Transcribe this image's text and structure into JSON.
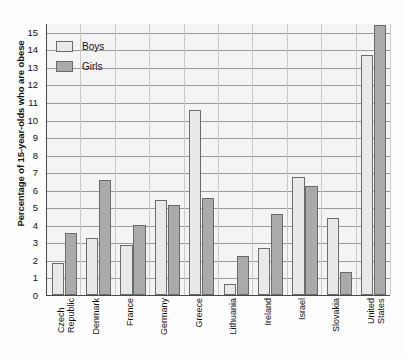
{
  "chart_data": {
    "type": "bar",
    "title": "",
    "xlabel": "",
    "ylabel": "Percentage of 15-year-olds who are obese",
    "ylim": [
      0,
      15.5
    ],
    "yticks": [
      0,
      1,
      2,
      3,
      4,
      5,
      6,
      7,
      8,
      9,
      10,
      11,
      12,
      13,
      14,
      15
    ],
    "ytick_labels": [
      "0",
      "1",
      "2",
      "3",
      "4",
      "5",
      "6",
      "7",
      "8",
      "9",
      "10",
      "11",
      "12",
      "13",
      "14",
      "15"
    ],
    "grid": true,
    "legend_position": "top-left",
    "categories": [
      "Czech Republic",
      "Denmark",
      "France",
      "Germany",
      "Greece",
      "Lithuania",
      "Ireland",
      "Israel",
      "Slovakia",
      "United States"
    ],
    "category_lines": [
      [
        "Czech",
        "Republic"
      ],
      [
        "Denmark"
      ],
      [
        "France"
      ],
      [
        "Germany"
      ],
      [
        "Greece"
      ],
      [
        "Lithuania"
      ],
      [
        "Ireland"
      ],
      [
        "Israel"
      ],
      [
        "Slovakia"
      ],
      [
        "United",
        "States"
      ]
    ],
    "series": [
      {
        "name": "Boys",
        "color": "#e9e9e9",
        "values": [
          1.85,
          3.25,
          2.85,
          5.4,
          10.55,
          0.6,
          2.7,
          6.7,
          4.4,
          13.7
        ]
      },
      {
        "name": "Girls",
        "color": "#aaaaaa",
        "values": [
          3.55,
          6.55,
          4.0,
          5.15,
          5.55,
          2.25,
          4.6,
          6.2,
          1.3,
          15.4
        ]
      }
    ]
  },
  "legend": {
    "items": [
      {
        "label": "Boys"
      },
      {
        "label": "Girls"
      }
    ]
  }
}
